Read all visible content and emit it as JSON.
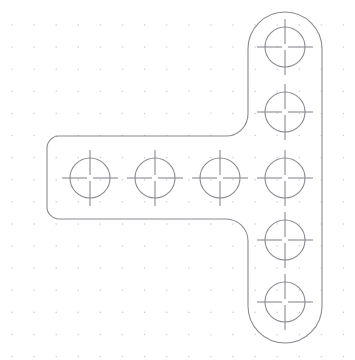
{
  "app": {
    "title": "CAD Part Drawing",
    "canvas_width": 355,
    "canvas_height": 360,
    "background_color": "#ffffff"
  },
  "style": {
    "outline_color": "#8a8a92",
    "hole_color": "#8a8a92",
    "center_mark_color": "#8a8a92",
    "grid_dot_color": "#c9c9d4",
    "outline_stroke_width": 1.1,
    "hole_stroke_width": 1.1
  },
  "grid": {
    "type": "dot-grid",
    "spacing": 22.1,
    "origin_x": 12,
    "origin_y": 25,
    "dot_radius": 0.75,
    "visible": true
  },
  "part": {
    "name": "t-shaped-bracket",
    "description": "Rotated T / cross-shaped flat bracket with rounded ends and filleted inside corners",
    "column": {
      "name": "vertical-column",
      "left": 248,
      "right": 322,
      "top": 12,
      "bottom": 343,
      "width": 74,
      "height": 331,
      "cap_radius": 37,
      "top_cap": "semicircular",
      "bottom_cap": "semicircular"
    },
    "arm": {
      "name": "horizontal-arm",
      "left": 47,
      "right": 248,
      "top": 136,
      "bottom": 219,
      "width": 201,
      "height": 83,
      "left_corner_radius": 12,
      "junction_fillet_radius": 22
    },
    "outline_path": "M 285 12 A 37 37 0 0 1 322 49 L 322 306 A 37 37 0 0 1 285 343 A 37 37 0 0 1 248 306 L 248 241 A 22 22 0 0 0 226 219 L 59 219 A 12 12 0 0 1 47 207 L 47 148 A 12 12 0 0 1 59 136 L 226 136 A 22 22 0 0 0 248 114 L 248 49 A 37 37 0 0 1 285 12 Z"
  },
  "holes": {
    "count": 9,
    "radius": 20,
    "center_mark_overshoot": 8,
    "center_mark_gap": 3,
    "row": {
      "name": "horizontal-hole-row",
      "y": 178,
      "pitch": 65,
      "x_values": [
        90,
        155,
        220,
        285
      ]
    },
    "column": {
      "name": "vertical-hole-column",
      "x": 285,
      "y_values": [
        47,
        112,
        178,
        240,
        302
      ]
    },
    "items": [
      {
        "id": "hole-1",
        "label": "H1",
        "cx": 90,
        "cy": 178,
        "r": 20,
        "group": "row"
      },
      {
        "id": "hole-2",
        "label": "H2",
        "cx": 155,
        "cy": 178,
        "r": 20,
        "group": "row"
      },
      {
        "id": "hole-3",
        "label": "H3",
        "cx": 220,
        "cy": 178,
        "r": 20,
        "group": "row"
      },
      {
        "id": "hole-4",
        "label": "H4",
        "cx": 285,
        "cy": 178,
        "r": 20,
        "group": "shared"
      },
      {
        "id": "hole-5",
        "label": "H5",
        "cx": 285,
        "cy": 47,
        "r": 20,
        "group": "column"
      },
      {
        "id": "hole-6",
        "label": "H6",
        "cx": 285,
        "cy": 112,
        "r": 20,
        "group": "column"
      },
      {
        "id": "hole-7",
        "label": "H7",
        "cx": 285,
        "cy": 240,
        "r": 20,
        "group": "column"
      },
      {
        "id": "hole-8",
        "label": "H8",
        "cx": 285,
        "cy": 302,
        "r": 20,
        "group": "column"
      }
    ]
  }
}
